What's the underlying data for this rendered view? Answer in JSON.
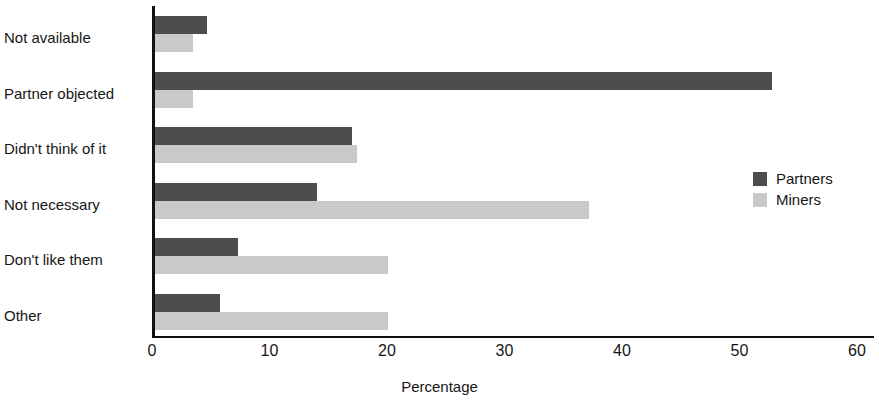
{
  "chart_data": {
    "type": "bar",
    "orientation": "horizontal",
    "title": "",
    "xlabel": "Percentage",
    "ylabel": "",
    "xlim": [
      0,
      60
    ],
    "xticks": [
      0,
      10,
      20,
      30,
      40,
      50,
      60
    ],
    "grid": false,
    "legend_position": "right",
    "categories": [
      "Not available",
      "Partner objected",
      "Didn't think of it",
      "Not necessary",
      "Don't like them",
      "Other"
    ],
    "series": [
      {
        "name": "Partners",
        "color": "#4d4d4d",
        "values": [
          4.4,
          52.5,
          16.8,
          13.8,
          7.1,
          5.5
        ]
      },
      {
        "name": "Miners",
        "color": "#c9c9c9",
        "values": [
          3.2,
          3.2,
          17.2,
          36.9,
          19.8,
          19.8
        ]
      }
    ]
  },
  "legend": {
    "items": [
      {
        "label": "Partners",
        "swatch": "partners"
      },
      {
        "label": "Miners",
        "swatch": "miners"
      }
    ]
  }
}
